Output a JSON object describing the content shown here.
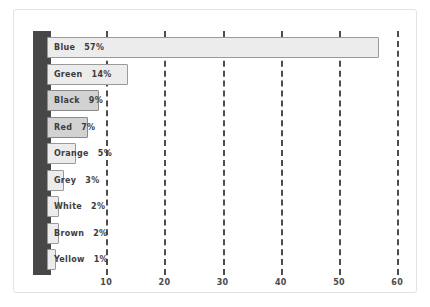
{
  "chart_data": {
    "type": "bar",
    "orientation": "horizontal",
    "title": "",
    "subtitle": "",
    "xlabel": "",
    "ylabel": "",
    "categories": [
      "Blue",
      "Green",
      "Black",
      "Red",
      "Orange",
      "Grey",
      "White",
      "Brown",
      "Yellow"
    ],
    "values": [
      57,
      14,
      9,
      7,
      5,
      3,
      2,
      2,
      1
    ],
    "value_labels": [
      "57%",
      "14%",
      "9%",
      "7%",
      "5%",
      "3%",
      "2%",
      "2%",
      "1%"
    ],
    "xlim": [
      0,
      62
    ],
    "xticks": [
      10,
      20,
      30,
      40,
      50,
      60
    ],
    "xtick_labels": [
      "10",
      "20",
      "30",
      "40",
      "50",
      "60"
    ],
    "grid": "vertical-dashed",
    "legend": "none",
    "bars": [
      {
        "category": "Blue",
        "value": 57,
        "label": "Blue",
        "value_label": "57%",
        "shade": "light"
      },
      {
        "category": "Green",
        "value": 14,
        "label": "Green",
        "value_label": "14%",
        "shade": "light"
      },
      {
        "category": "Black",
        "value": 9,
        "label": "Black",
        "value_label": "9%",
        "shade": "dark"
      },
      {
        "category": "Red",
        "value": 7,
        "label": "Red",
        "value_label": "7%",
        "shade": "dark"
      },
      {
        "category": "Orange",
        "value": 5,
        "label": "Orange",
        "value_label": "5%",
        "shade": "light"
      },
      {
        "category": "Grey",
        "value": 3,
        "label": "Grey",
        "value_label": "3%",
        "shade": "light"
      },
      {
        "category": "White",
        "value": 2,
        "label": "White",
        "value_label": "2%",
        "shade": "light"
      },
      {
        "category": "Brown",
        "value": 2,
        "label": "Brown",
        "value_label": "2%",
        "shade": "light"
      },
      {
        "category": "Yellow",
        "value": 1,
        "label": "Yellow",
        "value_label": "1%",
        "shade": "light"
      }
    ]
  },
  "colors": {
    "axis_band": "#474747",
    "gridline": "#4d4d4d",
    "bar_fill_light": "#ececec",
    "bar_fill_dark": "#d2d2d2",
    "bar_border": "#9a9a9a",
    "text": "#3c3c3c",
    "frame_border": "#e3e3e3",
    "background": "#ffffff"
  }
}
